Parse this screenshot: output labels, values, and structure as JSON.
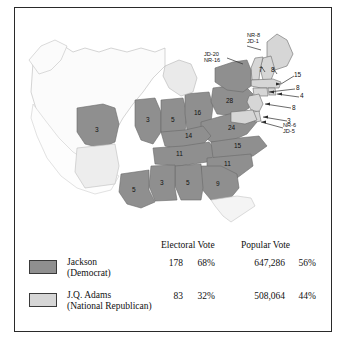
{
  "map": {
    "title": "1828 Presidential Election Map",
    "colors": {
      "jackson": "#8f8f8f",
      "adams": "#d6d6d6",
      "territory": "#f2f2f2",
      "outline": "#4a4a4a",
      "frame": "#2a2a2a",
      "text": "#111111"
    },
    "state_labels": [
      {
        "name": "missouri",
        "value": "3",
        "x": 80,
        "y": 122
      },
      {
        "name": "illinois",
        "value": "3",
        "x": 134,
        "y": 112
      },
      {
        "name": "indiana",
        "value": "5",
        "x": 159,
        "y": 112
      },
      {
        "name": "ohio",
        "value": "16",
        "x": 183,
        "y": 106
      },
      {
        "name": "pennsylvania",
        "value": "28",
        "x": 215,
        "y": 96
      },
      {
        "name": "kentucky",
        "value": "14",
        "x": 173,
        "y": 128
      },
      {
        "name": "virginia",
        "value": "24",
        "x": 209,
        "y": 123
      },
      {
        "name": "tennessee",
        "value": "11",
        "x": 163,
        "y": 146
      },
      {
        "name": "north-carolina",
        "value": "15",
        "x": 213,
        "y": 141
      },
      {
        "name": "south-carolina",
        "value": "11",
        "x": 203,
        "y": 155
      },
      {
        "name": "georgia",
        "value": "9",
        "x": 197,
        "y": 173
      },
      {
        "name": "alabama",
        "value": "5",
        "x": 171,
        "y": 172
      },
      {
        "name": "mississippi",
        "value": "3",
        "x": 148,
        "y": 170
      },
      {
        "name": "louisiana",
        "value": "5",
        "x": 119,
        "y": 182
      }
    ],
    "leader_labels": [
      {
        "name": "vermont",
        "value": "7",
        "x": 249,
        "y": 63
      },
      {
        "name": "new-hampshire",
        "value": "8",
        "x": 261,
        "y": 67
      },
      {
        "name": "massachusetts",
        "value": "15",
        "x": 280,
        "y": 66
      },
      {
        "name": "connecticut",
        "value": "8",
        "x": 281,
        "y": 79
      },
      {
        "name": "rhode-island",
        "value": "4",
        "x": 285,
        "y": 88
      },
      {
        "name": "new-jersey",
        "value": "8",
        "x": 277,
        "y": 99
      },
      {
        "name": "delaware",
        "value": "3",
        "x": 273,
        "y": 112
      }
    ],
    "split_labels": [
      {
        "name": "maine-split",
        "line1": "NR-8",
        "line2": "JD-1",
        "x": 233,
        "y": 27
      },
      {
        "name": "new-york-split",
        "line1": "JD-20",
        "line2": "NR-16",
        "x": 190,
        "y": 46
      },
      {
        "name": "maryland-split",
        "line1": "NR-6",
        "line2": "JD-5",
        "x": 268,
        "y": 117
      }
    ]
  },
  "legend": {
    "columns": {
      "electoral": "Electoral Vote",
      "popular": "Popular Vote"
    },
    "rows": [
      {
        "name": "jackson",
        "label_line1": "Jackson",
        "label_line2": "(Democrat)",
        "swatch": "#8f8f8f",
        "electoral_votes": "178",
        "electoral_pct": "68%",
        "popular_votes": "647,286",
        "popular_pct": "56%"
      },
      {
        "name": "adams",
        "label_line1": "J.Q. Adams",
        "label_line2": "(National Republican)",
        "swatch": "#d6d6d6",
        "electoral_votes": "83",
        "electoral_pct": "32%",
        "popular_votes": "508,064",
        "popular_pct": "44%"
      }
    ]
  }
}
